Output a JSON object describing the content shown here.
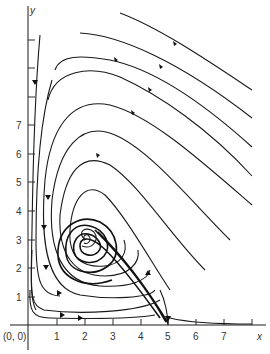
{
  "figure": {
    "type": "phase-portrait",
    "origin_label": "(0, 0)",
    "x_axis": {
      "label": "x",
      "ticks": [
        "1",
        "2",
        "3",
        "4",
        "5",
        "6",
        "7"
      ]
    },
    "y_axis": {
      "label": "y",
      "ticks": [
        "1",
        "2",
        "3",
        "4",
        "5",
        "6",
        "7"
      ]
    },
    "equilibrium": {
      "x": 2,
      "y": 3,
      "kind": "stable spiral"
    },
    "line_color": "#1a1a1a",
    "background": "#ffffff"
  }
}
